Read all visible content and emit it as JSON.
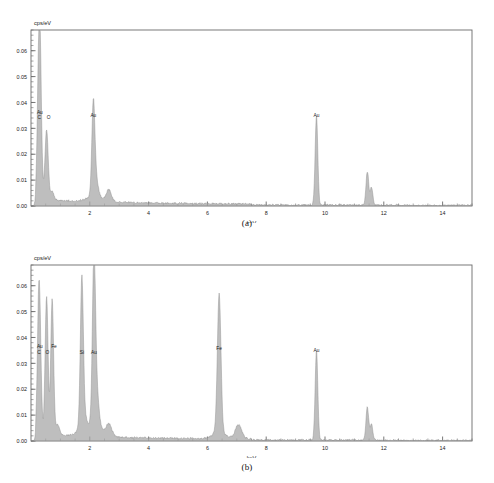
{
  "figure": {
    "panels": [
      {
        "id": "a",
        "caption": "(a)",
        "ylabel": "cps/eV",
        "xlabel": "keV"
      },
      {
        "id": "b",
        "caption": "(b)",
        "ylabel": "cps/eV",
        "xlabel": "keV"
      }
    ]
  },
  "axis": {
    "x_ticks": [
      "2",
      "4",
      "6",
      "8",
      "10",
      "12",
      "14"
    ],
    "y_ticks": [
      "0.00",
      "0.01",
      "0.02",
      "0.03",
      "0.04",
      "0.05",
      "0.06"
    ]
  },
  "colors": {
    "frame": "#6a6a6a",
    "trace": "#8c8c8c",
    "trace_fill": "#a8a8a8",
    "peak_line": "#9a9a9a",
    "text": "#1a1a1a"
  },
  "chart_data": [
    {
      "type": "line",
      "title": "(a)",
      "xlabel": "keV",
      "ylabel": "cps/eV",
      "xlim": [
        0,
        15
      ],
      "ylim": [
        0,
        0.068
      ],
      "xticks": [
        2,
        4,
        6,
        8,
        10,
        12,
        14
      ],
      "yticks": [
        0.0,
        0.01,
        0.02,
        0.03,
        0.04,
        0.05,
        0.06
      ],
      "ytick_labels": [
        "0.00",
        "0.01",
        "0.02",
        "0.03",
        "0.04",
        "0.05",
        "0.06"
      ],
      "grid": false,
      "legend": "none",
      "annotations": [
        {
          "label": "Au",
          "x": 0.3,
          "y": 0.0355
        },
        {
          "label": "C",
          "x": 0.28,
          "y": 0.0335
        },
        {
          "label": "O",
          "x": 0.6,
          "y": 0.0335
        },
        {
          "label": "Au",
          "x": 2.12,
          "y": 0.0345
        },
        {
          "label": "Au",
          "x": 9.71,
          "y": 0.0345
        }
      ],
      "peaks": [
        {
          "element": "C",
          "x": 0.28,
          "y": 0.0655,
          "width": 0.055
        },
        {
          "element": "Au",
          "x": 0.33,
          "y": 0.013,
          "width": 0.045
        },
        {
          "element": "O",
          "x": 0.53,
          "y": 0.027,
          "width": 0.055
        },
        {
          "element": "",
          "x": 0.72,
          "y": 0.0035,
          "width": 0.06
        },
        {
          "element": "Au",
          "x": 2.12,
          "y": 0.0335,
          "width": 0.05
        },
        {
          "element": "",
          "x": 2.2,
          "y": 0.0075,
          "width": 0.08
        },
        {
          "element": "",
          "x": 2.65,
          "y": 0.0035,
          "width": 0.08
        },
        {
          "element": "Au",
          "x": 9.71,
          "y": 0.0345,
          "width": 0.045
        },
        {
          "element": "",
          "x": 11.44,
          "y": 0.013,
          "width": 0.045
        },
        {
          "element": "",
          "x": 11.58,
          "y": 0.0068,
          "width": 0.045
        }
      ]
    },
    {
      "type": "line",
      "title": "(b)",
      "xlabel": "keV",
      "ylabel": "cps/eV",
      "xlim": [
        0,
        15
      ],
      "ylim": [
        0,
        0.068
      ],
      "xticks": [
        2,
        4,
        6,
        8,
        10,
        12,
        14
      ],
      "yticks": [
        0.0,
        0.01,
        0.02,
        0.03,
        0.04,
        0.05,
        0.06
      ],
      "ytick_labels": [
        "0.00",
        "0.01",
        "0.02",
        "0.03",
        "0.04",
        "0.05",
        "0.06"
      ],
      "grid": false,
      "legend": "none",
      "annotations": [
        {
          "label": "Au",
          "x": 0.3,
          "y": 0.036
        },
        {
          "label": "C",
          "x": 0.27,
          "y": 0.0335
        },
        {
          "label": "O",
          "x": 0.56,
          "y": 0.0335
        },
        {
          "label": "Fe",
          "x": 0.78,
          "y": 0.036
        },
        {
          "label": "Si",
          "x": 1.73,
          "y": 0.0335
        },
        {
          "label": "Au",
          "x": 2.14,
          "y": 0.0335
        },
        {
          "label": "Fe",
          "x": 6.4,
          "y": 0.035
        },
        {
          "label": "Au",
          "x": 9.71,
          "y": 0.0345
        }
      ],
      "peaks": [
        {
          "element": "C",
          "x": 0.27,
          "y": 0.056,
          "width": 0.05
        },
        {
          "element": "Au",
          "x": 0.33,
          "y": 0.01,
          "width": 0.045
        },
        {
          "element": "O",
          "x": 0.53,
          "y": 0.0535,
          "width": 0.05
        },
        {
          "element": "Fe",
          "x": 0.72,
          "y": 0.0525,
          "width": 0.048
        },
        {
          "element": "",
          "x": 0.9,
          "y": 0.004,
          "width": 0.07
        },
        {
          "element": "Si",
          "x": 1.73,
          "y": 0.054,
          "width": 0.05
        },
        {
          "element": "",
          "x": 1.78,
          "y": 0.006,
          "width": 0.1
        },
        {
          "element": "Au",
          "x": 2.14,
          "y": 0.0545,
          "width": 0.05
        },
        {
          "element": "",
          "x": 2.2,
          "y": 0.019,
          "width": 0.09
        },
        {
          "element": "",
          "x": 2.65,
          "y": 0.0045,
          "width": 0.1
        },
        {
          "element": "Fe",
          "x": 6.4,
          "y": 0.0535,
          "width": 0.06
        },
        {
          "element": "",
          "x": 7.06,
          "y": 0.0045,
          "width": 0.1
        },
        {
          "element": "Au",
          "x": 9.71,
          "y": 0.0345,
          "width": 0.045
        },
        {
          "element": "",
          "x": 11.44,
          "y": 0.0128,
          "width": 0.045
        },
        {
          "element": "",
          "x": 11.58,
          "y": 0.006,
          "width": 0.045
        }
      ]
    }
  ]
}
